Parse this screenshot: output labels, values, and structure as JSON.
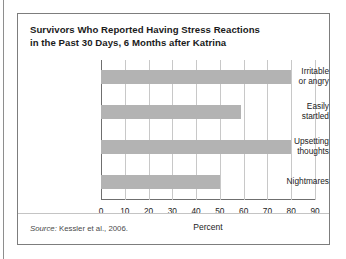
{
  "figure": {
    "title_line1": "Survivors Who Reported Having Stress Reactions",
    "title_line2": "in the Past 30 Days, 6 Months after Katrina",
    "source_prefix": "Source:",
    "source_text": " Kessler et al., 2006."
  },
  "colors": {
    "bar": "#b3b3b3",
    "gridline": "#c8c8c8",
    "axis": "#6f6f6f",
    "border": "#7d7d7d",
    "text": "#1b1b1b"
  },
  "chart_data": {
    "type": "bar",
    "orientation": "horizontal",
    "title": "Survivors Who Reported Having Stress Reactions in the Past 30 Days, 6 Months after Katrina",
    "categories": [
      "Irritable or angry",
      "Easily startled",
      "Upsetting thoughts",
      "Nightmares"
    ],
    "category_lines": [
      [
        "Irritable",
        "or angry"
      ],
      [
        "Easily",
        "startled"
      ],
      [
        "Upsetting",
        "thoughts"
      ],
      [
        "Nightmares"
      ]
    ],
    "values": [
      80,
      59,
      80,
      50
    ],
    "xlabel": "Percent",
    "ylabel": "",
    "xlim": [
      0,
      90
    ],
    "xticks": [
      0,
      10,
      20,
      30,
      40,
      50,
      60,
      70,
      80,
      90
    ],
    "xtick_labels": [
      "0",
      "10",
      "20",
      "30",
      "40",
      "50",
      "60",
      "70",
      "80",
      "90"
    ],
    "grid": "vertical",
    "legend": "none"
  }
}
